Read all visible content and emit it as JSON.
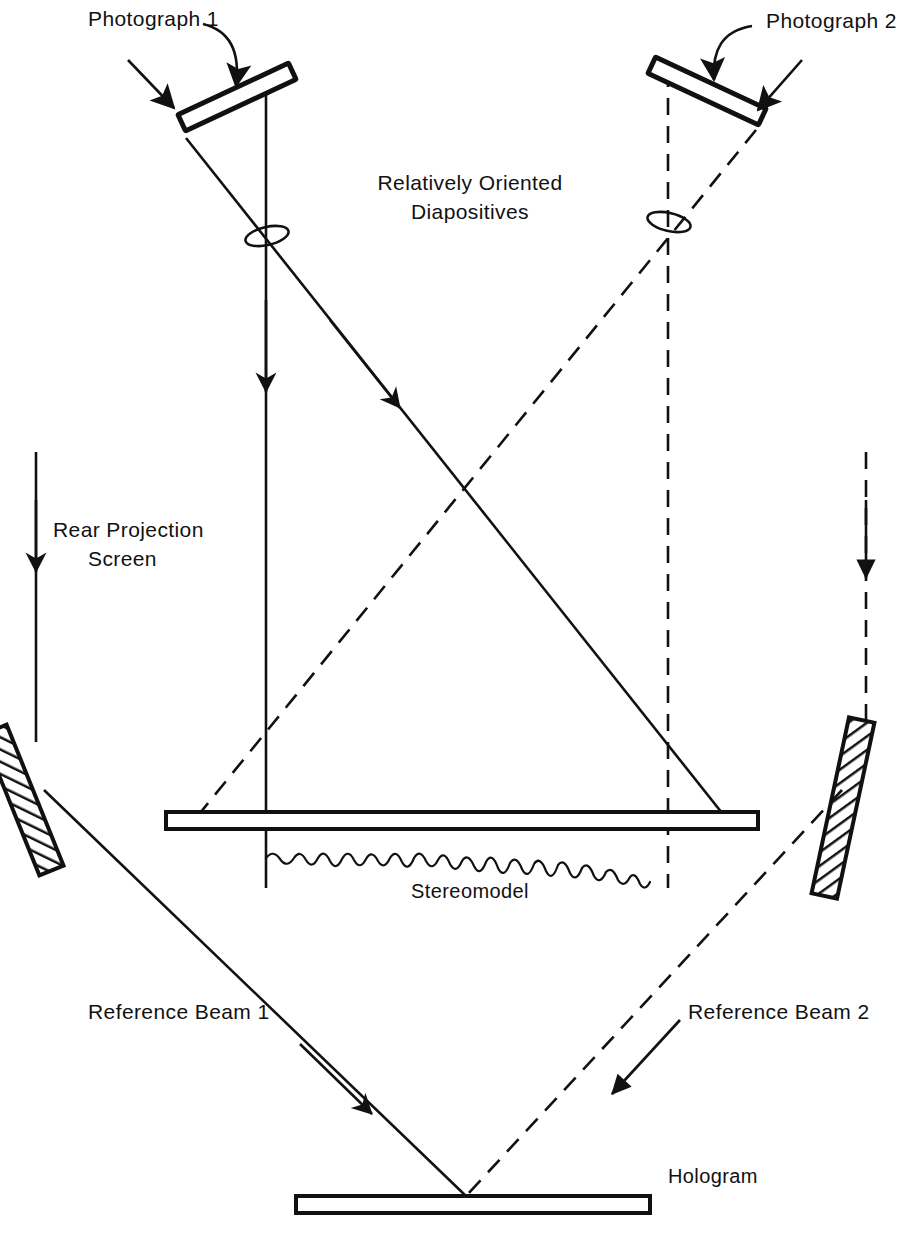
{
  "diagram": {
    "domain": "Diagram",
    "type": "optical-ray-diagram",
    "title_text": "",
    "background_color": "#ffffff",
    "ink_color": "#111111",
    "labels": {
      "photograph_1": "Photograph 1",
      "photograph_2": "Photograph 2",
      "relatively_oriented_line1": "Relatively Oriented",
      "relatively_oriented_line2": "Diapositives",
      "rear_projection_line1": "Rear Projection",
      "rear_projection_line2": "Screen",
      "stereomodel": "Stereomodel",
      "reference_beam_1": "Reference Beam 1",
      "reference_beam_2": "Reference Beam 2",
      "hologram": "Hologram"
    },
    "components": [
      {
        "name": "diapositive-plate-1",
        "label": "Photograph 1",
        "kind": "tilted-plate",
        "side": "left",
        "line_style": "solid"
      },
      {
        "name": "diapositive-plate-2",
        "label": "Photograph 2",
        "kind": "tilted-plate",
        "side": "right",
        "line_style": "solid"
      },
      {
        "name": "projector-lens-1",
        "label": "",
        "kind": "lens-ellipse",
        "side": "left",
        "line_style": "solid"
      },
      {
        "name": "projector-lens-2",
        "label": "",
        "kind": "lens-ellipse",
        "side": "right",
        "line_style": "solid"
      },
      {
        "name": "rear-projection-screen",
        "label": "Rear Projection Screen",
        "kind": "horizontal-bar",
        "side": "center",
        "line_style": "solid"
      },
      {
        "name": "stereomodel-terrain",
        "label": "Stereomodel",
        "kind": "wavy-profile",
        "side": "center",
        "line_style": "solid"
      },
      {
        "name": "mirror-left",
        "label": "",
        "kind": "hatched-mirror",
        "side": "left",
        "line_style": "hatched"
      },
      {
        "name": "mirror-right",
        "label": "",
        "kind": "hatched-mirror",
        "side": "right",
        "line_style": "hatched"
      },
      {
        "name": "hologram-plate",
        "label": "Hologram",
        "kind": "horizontal-bar",
        "side": "center",
        "line_style": "solid"
      }
    ],
    "beams": [
      {
        "name": "object-beam-1-vertical",
        "line_style": "solid",
        "direction": "downward",
        "has_arrow": true
      },
      {
        "name": "object-beam-1-diagonal",
        "line_style": "solid",
        "direction": "down-right",
        "has_arrow": true
      },
      {
        "name": "object-beam-2-vertical",
        "line_style": "dashed",
        "direction": "downward",
        "has_arrow": true
      },
      {
        "name": "object-beam-2-diagonal",
        "line_style": "dashed",
        "direction": "down-left",
        "has_arrow": false
      },
      {
        "name": "reference-beam-1",
        "label": "Reference Beam 1",
        "line_style": "solid",
        "direction": "down-right",
        "has_arrow": true
      },
      {
        "name": "reference-beam-2",
        "label": "Reference Beam 2",
        "line_style": "dashed",
        "direction": "down-left",
        "has_arrow": true
      },
      {
        "name": "reference-feed-left",
        "line_style": "solid",
        "direction": "downward",
        "has_arrow": true
      },
      {
        "name": "reference-feed-right",
        "line_style": "dashed",
        "direction": "downward",
        "has_arrow": true
      },
      {
        "name": "pointer-arrow-photograph-1-curved",
        "line_style": "solid",
        "direction": "curved-down",
        "has_arrow": true
      },
      {
        "name": "pointer-arrow-photograph-1-straight",
        "line_style": "solid",
        "direction": "down-right",
        "has_arrow": true
      },
      {
        "name": "pointer-arrow-photograph-2-curved",
        "line_style": "solid",
        "direction": "curved-down",
        "has_arrow": true
      },
      {
        "name": "pointer-arrow-photograph-2-straight",
        "line_style": "solid",
        "direction": "down-left",
        "has_arrow": true
      }
    ]
  }
}
